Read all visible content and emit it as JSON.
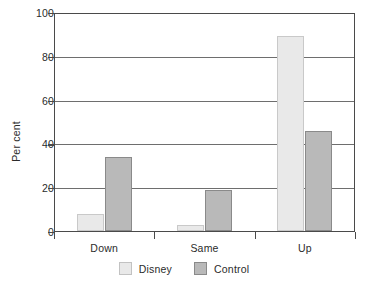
{
  "chart_data": {
    "type": "bar",
    "title": "",
    "xlabel": "",
    "ylabel": "Per cent",
    "categories": [
      "Down",
      "Same",
      "Up"
    ],
    "series": [
      {
        "name": "Disney",
        "values": [
          8,
          3,
          90
        ],
        "color": "#e9e9e9"
      },
      {
        "name": "Control",
        "values": [
          34,
          19,
          46
        ],
        "color": "#b9b9b9"
      }
    ],
    "ylim": [
      0,
      100
    ],
    "yticks": [
      0,
      20,
      40,
      60,
      80,
      100
    ],
    "ytick_labels": [
      "0",
      "20",
      "40",
      "60",
      "80",
      "100"
    ],
    "grid": true,
    "grid_axis": "y",
    "legend_position": "bottom-center"
  },
  "legend": {
    "items": [
      {
        "label": "Disney"
      },
      {
        "label": "Control"
      }
    ]
  },
  "axes": {
    "y_title": "Per cent",
    "y_tick_labels": [
      "100",
      "80",
      "60",
      "40",
      "20",
      "0"
    ],
    "x_tick_labels": [
      "Down",
      "Same",
      "Up"
    ]
  }
}
